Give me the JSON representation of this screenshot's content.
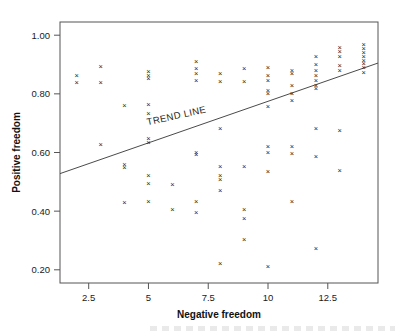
{
  "chart_data": {
    "type": "scatter",
    "title": "",
    "xlabel": "Negative freedom",
    "ylabel": "Positive freedom",
    "xlim": [
      1.3,
      14.6
    ],
    "ylim": [
      0.155,
      1.045
    ],
    "xticks": [
      2.5,
      5,
      7.5,
      10,
      12.5
    ],
    "xtick_labels": [
      "2.5",
      "5",
      "7.5",
      "10",
      "12.5"
    ],
    "yticks": [
      0.2,
      0.4,
      0.6,
      0.8,
      1.0
    ],
    "ytick_labels": [
      "0.20",
      "0.40",
      "0.60",
      "0.80",
      "1.00"
    ],
    "grid": false,
    "legend": false,
    "marker": "x",
    "marker_color": "#2a2a2a",
    "frame_color": "#555555",
    "annotations": [
      {
        "text": "TREND LINE",
        "x": 6.2,
        "y": 0.715,
        "rotation": -12.5
      }
    ],
    "trendline": {
      "label": "TREND LINE",
      "x0": 1.3,
      "y0": 0.528,
      "x1": 14.6,
      "y1": 0.905,
      "color": "#4a4a4a"
    },
    "points": [
      {
        "x": 2.0,
        "y": 0.862
      },
      {
        "x": 2.0,
        "y": 0.84
      },
      {
        "x": 3.0,
        "y": 0.893
      },
      {
        "x": 3.0,
        "y": 0.841
      },
      {
        "x": 3.0,
        "y": 0.63
      },
      {
        "x": 4.0,
        "y": 0.762
      },
      {
        "x": 4.0,
        "y": 0.56
      },
      {
        "x": 4.0,
        "y": 0.549
      },
      {
        "x": 4.0,
        "y": 0.432
      },
      {
        "x": 5.0,
        "y": 0.878
      },
      {
        "x": 5.0,
        "y": 0.864
      },
      {
        "x": 5.0,
        "y": 0.855
      },
      {
        "x": 5.0,
        "y": 0.763
      },
      {
        "x": 5.0,
        "y": 0.735
      },
      {
        "x": 5.0,
        "y": 0.648
      },
      {
        "x": 5.0,
        "y": 0.634
      },
      {
        "x": 5.0,
        "y": 0.524
      },
      {
        "x": 5.0,
        "y": 0.494
      },
      {
        "x": 5.0,
        "y": 0.434
      },
      {
        "x": 6.0,
        "y": 0.493
      },
      {
        "x": 6.0,
        "y": 0.405
      },
      {
        "x": 7.0,
        "y": 0.913
      },
      {
        "x": 7.0,
        "y": 0.888
      },
      {
        "x": 7.0,
        "y": 0.871
      },
      {
        "x": 7.0,
        "y": 0.845
      },
      {
        "x": 7.0,
        "y": 0.601
      },
      {
        "x": 7.0,
        "y": 0.594
      },
      {
        "x": 7.0,
        "y": 0.433
      },
      {
        "x": 7.0,
        "y": 0.395
      },
      {
        "x": 8.0,
        "y": 0.871
      },
      {
        "x": 8.0,
        "y": 0.844
      },
      {
        "x": 8.0,
        "y": 0.682
      },
      {
        "x": 8.0,
        "y": 0.554
      },
      {
        "x": 8.0,
        "y": 0.523
      },
      {
        "x": 8.0,
        "y": 0.508
      },
      {
        "x": 8.0,
        "y": 0.472
      },
      {
        "x": 8.0,
        "y": 0.222
      },
      {
        "x": 9.0,
        "y": 0.886
      },
      {
        "x": 9.0,
        "y": 0.843
      },
      {
        "x": 9.0,
        "y": 0.554
      },
      {
        "x": 9.0,
        "y": 0.405
      },
      {
        "x": 9.0,
        "y": 0.377
      },
      {
        "x": 9.0,
        "y": 0.303
      },
      {
        "x": 10.0,
        "y": 0.89
      },
      {
        "x": 10.0,
        "y": 0.862
      },
      {
        "x": 10.0,
        "y": 0.846
      },
      {
        "x": 10.0,
        "y": 0.812
      },
      {
        "x": 10.0,
        "y": 0.802
      },
      {
        "x": 10.0,
        "y": 0.757
      },
      {
        "x": 10.0,
        "y": 0.623
      },
      {
        "x": 10.0,
        "y": 0.6
      },
      {
        "x": 10.0,
        "y": 0.537
      },
      {
        "x": 10.0,
        "y": 0.213
      },
      {
        "x": 11.0,
        "y": 0.879
      },
      {
        "x": 11.0,
        "y": 0.869
      },
      {
        "x": 11.0,
        "y": 0.828
      },
      {
        "x": 11.0,
        "y": 0.803
      },
      {
        "x": 11.0,
        "y": 0.777
      },
      {
        "x": 11.0,
        "y": 0.623
      },
      {
        "x": 11.0,
        "y": 0.598
      },
      {
        "x": 11.0,
        "y": 0.434
      },
      {
        "x": 12.0,
        "y": 0.93
      },
      {
        "x": 12.0,
        "y": 0.9
      },
      {
        "x": 12.0,
        "y": 0.88
      },
      {
        "x": 12.0,
        "y": 0.862
      },
      {
        "x": 12.0,
        "y": 0.845
      },
      {
        "x": 12.0,
        "y": 0.831
      },
      {
        "x": 12.0,
        "y": 0.818
      },
      {
        "x": 12.0,
        "y": 0.684
      },
      {
        "x": 12.0,
        "y": 0.588
      },
      {
        "x": 12.0,
        "y": 0.272
      },
      {
        "x": 13.0,
        "y": 0.96
      },
      {
        "x": 13.0,
        "y": 0.945
      },
      {
        "x": 13.0,
        "y": 0.93
      },
      {
        "x": 13.0,
        "y": 0.896
      },
      {
        "x": 13.0,
        "y": 0.88
      },
      {
        "x": 13.0,
        "y": 0.676
      },
      {
        "x": 13.0,
        "y": 0.538
      },
      {
        "x": 14.0,
        "y": 0.968
      },
      {
        "x": 14.0,
        "y": 0.955
      },
      {
        "x": 14.0,
        "y": 0.942
      },
      {
        "x": 14.0,
        "y": 0.929
      },
      {
        "x": 14.0,
        "y": 0.916
      },
      {
        "x": 14.0,
        "y": 0.903
      },
      {
        "x": 14.0,
        "y": 0.89
      },
      {
        "x": 14.0,
        "y": 0.874
      }
    ]
  }
}
